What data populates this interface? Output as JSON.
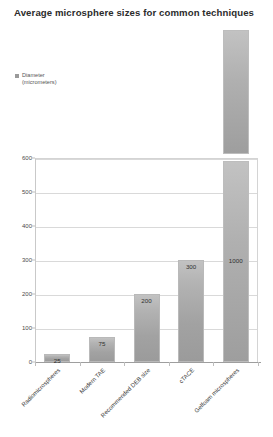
{
  "chart_data": {
    "type": "bar",
    "title": "Average microsphere sizes for common techniques",
    "xlabel": "",
    "ylabel": "",
    "ylim": [
      0,
      600
    ],
    "ytick_values": [
      0,
      100,
      200,
      300,
      400,
      500,
      600
    ],
    "ytick_labels": [
      "0",
      "100",
      "200",
      "300",
      "400",
      "500",
      "600"
    ],
    "grid": true,
    "legend_position": "top-left",
    "legend": [
      {
        "label": "Diameter\n(micrometers)",
        "color": "#9a9a9a"
      }
    ],
    "categories": [
      "Radiomicrospheres",
      "Modern TAE",
      "Recommended DEB size",
      "cTACE",
      "Gelfoam microspheres"
    ],
    "values": [
      25,
      75,
      200,
      300,
      1000
    ],
    "value_labels": [
      "25",
      "75",
      "200",
      "300",
      "1000"
    ],
    "bar_color": "#ababab",
    "gridline_color": "#d9d9d9",
    "axis_color": "#9e9e9e"
  },
  "caption": {
    "text": ""
  }
}
